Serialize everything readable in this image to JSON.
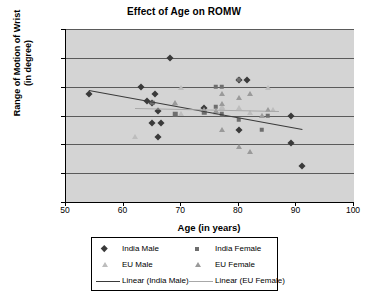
{
  "chart_data": {
    "type": "scatter",
    "title": "Effect of Age on ROMW",
    "xlabel": "Age (in years)",
    "ylabel_line1": "Range of Motion of Wrist",
    "ylabel_line2": "(in degree)",
    "xlim": [
      50,
      100
    ],
    "ylim": [
      0,
      120
    ],
    "xticks": [
      50,
      60,
      70,
      80,
      90,
      100
    ],
    "yticks": [
      0,
      20,
      40,
      60,
      80,
      100,
      120
    ],
    "grid": "horizontal",
    "plot_background": "#d4d4d4",
    "legend_position": "bottom",
    "series": [
      {
        "name": "India Male",
        "marker": "diamond",
        "color": "#3a3a3a",
        "points": [
          [
            54,
            75
          ],
          [
            63,
            80
          ],
          [
            64,
            70
          ],
          [
            65,
            55
          ],
          [
            65,
            69
          ],
          [
            65.5,
            75
          ],
          [
            66,
            45
          ],
          [
            66,
            63
          ],
          [
            66.5,
            55
          ],
          [
            68,
            100
          ],
          [
            74,
            65
          ],
          [
            80,
            85
          ],
          [
            81.5,
            85
          ],
          [
            80,
            50
          ],
          [
            89,
            60
          ],
          [
            89,
            41
          ],
          [
            91,
            25
          ]
        ]
      },
      {
        "name": "India Female",
        "marker": "square",
        "color": "#6e6e6e",
        "points": [
          [
            65,
            69
          ],
          [
            69,
            61
          ],
          [
            74,
            62
          ],
          [
            76,
            80
          ],
          [
            76,
            66
          ],
          [
            77,
            80
          ],
          [
            77,
            61
          ],
          [
            80,
            85
          ],
          [
            80,
            57
          ],
          [
            84,
            50
          ],
          [
            85,
            60
          ]
        ]
      },
      {
        "name": "EU Male",
        "marker": "triangle",
        "color": "#bdbdbd",
        "points": [
          [
            62,
            45
          ],
          [
            69,
            68
          ],
          [
            70,
            79
          ],
          [
            70,
            61
          ],
          [
            76,
            62
          ],
          [
            77,
            66
          ],
          [
            77,
            65
          ],
          [
            80,
            65
          ],
          [
            82,
            62
          ],
          [
            84,
            60
          ],
          [
            85,
            79
          ],
          [
            86,
            64
          ]
        ]
      },
      {
        "name": "EU Female",
        "marker": "triangle",
        "color": "#9a9a9a",
        "points": [
          [
            69,
            69
          ],
          [
            74,
            64
          ],
          [
            76,
            63
          ],
          [
            77,
            75
          ],
          [
            77,
            68
          ],
          [
            77,
            50
          ],
          [
            80,
            72
          ],
          [
            80,
            38
          ],
          [
            82,
            75
          ],
          [
            82,
            35
          ],
          [
            84,
            60
          ],
          [
            85,
            64
          ]
        ]
      }
    ],
    "trendlines": [
      {
        "name": "Linear (India Male)",
        "color": "#3a3a3a",
        "x_start": 54,
        "y_start": 78,
        "x_end": 91,
        "y_end": 51
      },
      {
        "name": "Linear (EU Female)",
        "color": "#a8a8a8",
        "x_start": 62,
        "y_start": 65,
        "x_end": 87,
        "y_end": 63
      }
    ],
    "legend": [
      {
        "label": "India Male",
        "key": "diamond-marker",
        "color": "#3a3a3a"
      },
      {
        "label": "India Female",
        "key": "square-marker",
        "color": "#6e6e6e"
      },
      {
        "label": "EU Male",
        "key": "triangle-marker",
        "color": "#bdbdbd"
      },
      {
        "label": "EU Female",
        "key": "triangle-marker",
        "color": "#9a9a9a"
      },
      {
        "label": "Linear (India Male)",
        "key": "line-swatch",
        "color": "#3a3a3a"
      },
      {
        "label": "Linear (EU Female)",
        "key": "line-swatch",
        "color": "#a8a8a8"
      }
    ]
  }
}
